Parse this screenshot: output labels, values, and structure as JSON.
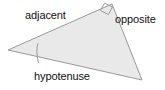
{
  "figure": {
    "type": "right-triangle-trigonometry-diagram",
    "width": 165,
    "height": 90,
    "background_color": "#ffffff"
  },
  "triangle": {
    "fill_color": "#e9e9e9",
    "stroke_color": "#9a9a9a",
    "stroke_width": 1,
    "vertices": [
      {
        "name": "left-acute-vertex",
        "x": 8,
        "y": 50
      },
      {
        "name": "top-right-angle-vertex",
        "x": 112,
        "y": 4
      },
      {
        "name": "bottom-right-vertex",
        "x": 142,
        "y": 80
      }
    ]
  },
  "markers": {
    "right_angle": {
      "label": "right-angle-marker",
      "at_vertex": "top-right-angle-vertex",
      "stroke_color": "#9a9a9a",
      "points": "104.5,3.2 112.5,7.0 108.3,14.6 100.5,10.4"
    },
    "angle_arc": {
      "label": "angle-arc-marker",
      "at_vertex": "left-acute-vertex",
      "stroke_color": "#9a9a9a",
      "path": "M 38.5,63.0 Q 35.5,50.5 38.0,43.2"
    }
  },
  "labels": {
    "adjacent": "adjacent",
    "opposite": "opposite",
    "hypotenuse": "hypotenuse",
    "text_color": "#111111",
    "font_size_px": 11
  },
  "sides": [
    {
      "name": "adjacent",
      "label": "adjacent",
      "from": "left-acute-vertex",
      "to": "top-right-angle-vertex"
    },
    {
      "name": "opposite",
      "label": "opposite",
      "from": "top-right-angle-vertex",
      "to": "bottom-right-vertex"
    },
    {
      "name": "hypotenuse",
      "label": "hypotenuse",
      "from": "left-acute-vertex",
      "to": "bottom-right-vertex"
    }
  ]
}
